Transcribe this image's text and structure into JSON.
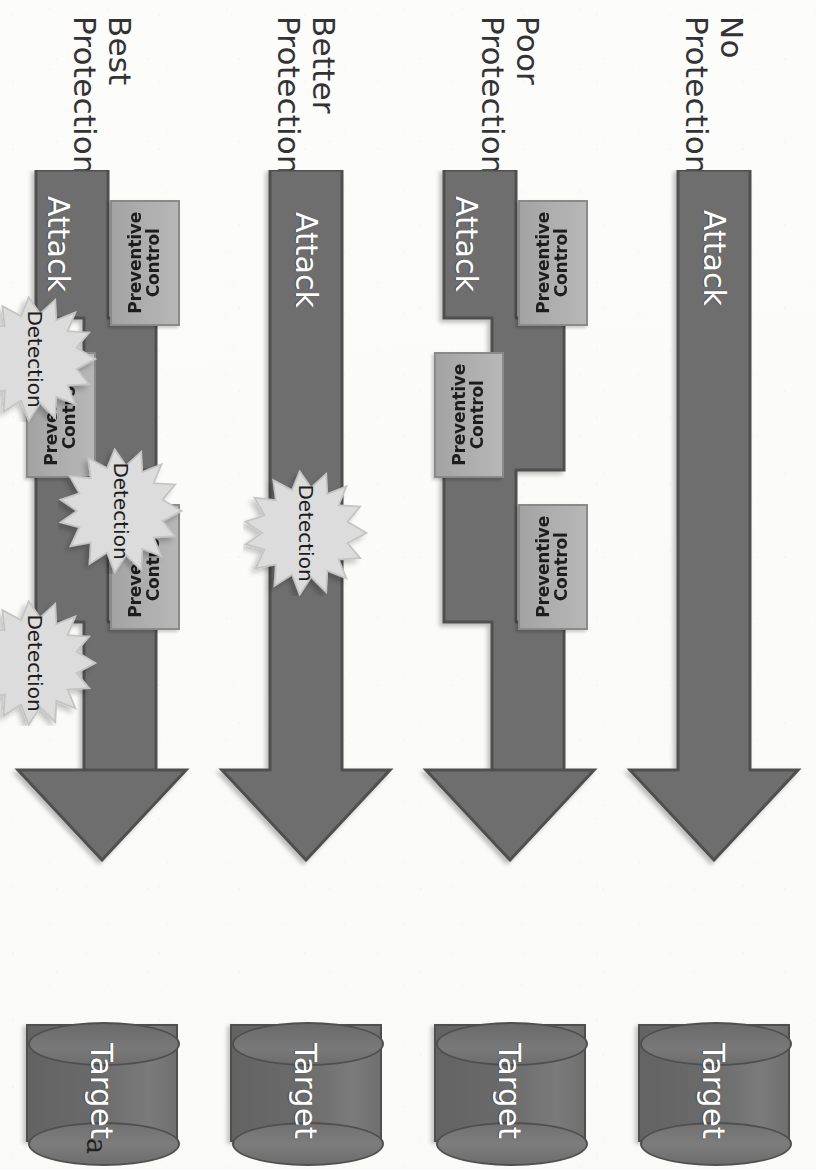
{
  "figure": {
    "stray_mark": "a",
    "colors": {
      "arrow_fill": "#6e6e6e",
      "arrow_stroke": "#4f4f4f",
      "control_fill": "#aeaeae",
      "control_stroke": "#8a8a8a",
      "detection_fill": "#dcdcdc",
      "detection_stroke": "#c2c2c2",
      "target_fill": "#737373",
      "text_on_dark": "#ffffff",
      "text_on_light": "#1d1d1d",
      "page_background": "#fcfcfb"
    },
    "labels": {
      "attack": "Attack",
      "target": "Target",
      "preventive_control": "Preventive\nControl",
      "detection": "Detection"
    },
    "rows": [
      {
        "id": "no-protection",
        "caption_line1": "No",
        "caption_line2": "Protection",
        "attack": "Attack",
        "target": "Target",
        "preventive_controls": 0,
        "detections": 0
      },
      {
        "id": "poor-protection",
        "caption_line1": "Poor",
        "caption_line2": "Protection",
        "attack": "Attack",
        "target": "Target",
        "preventive_controls": 3,
        "detections": 0
      },
      {
        "id": "better-protection",
        "caption_line1": "Better",
        "caption_line2": "Protection",
        "attack": "Attack",
        "target": "Target",
        "preventive_controls": 0,
        "detections": 1
      },
      {
        "id": "best-protection",
        "caption_line1": "Best",
        "caption_line2": "Protection",
        "attack": "Attack",
        "target": "Target",
        "preventive_controls": 3,
        "detections": 3
      }
    ]
  }
}
